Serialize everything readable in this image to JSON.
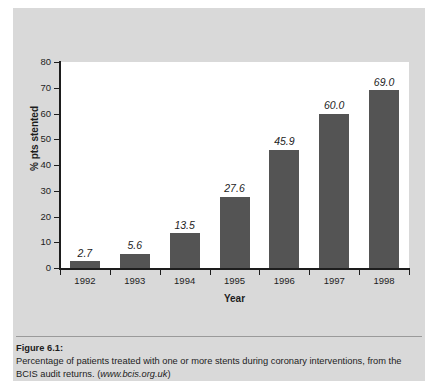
{
  "figure": {
    "caption_title": "Figure 6.1:",
    "caption_body_before": "Percentage of patients treated with one or more stents during coronary interventions, from the BCIS audit returns. (",
    "caption_url": "www.bcis.org.uk",
    "caption_body_after": ")"
  },
  "colors": {
    "panel_background": "#d9d9d9",
    "plot_background": "#ffffff",
    "bar_fill": "#545454",
    "axis": "#1d1d1d",
    "page_background": "#ffffff"
  },
  "chart_data": {
    "type": "bar",
    "title": "",
    "xlabel": "Year",
    "ylabel": "% pts stented",
    "categories": [
      "1992",
      "1993",
      "1994",
      "1995",
      "1996",
      "1997",
      "1998"
    ],
    "values": [
      2.7,
      5.6,
      13.5,
      27.6,
      45.9,
      60.0,
      69.0
    ],
    "data_labels": [
      "2.7",
      "5.6",
      "13.5",
      "27.6",
      "45.9",
      "60.0",
      "69.0"
    ],
    "ylim": [
      0,
      80
    ],
    "ytick_values": [
      0,
      10,
      20,
      30,
      40,
      50,
      60,
      70,
      80
    ],
    "ytick_labels": [
      "0",
      "10",
      "20",
      "30",
      "40",
      "50",
      "60",
      "70",
      "80"
    ],
    "grid": false,
    "legend": false,
    "legend_position": "none",
    "series": [
      {
        "name": "% pts stented",
        "values": [
          2.7,
          5.6,
          13.5,
          27.6,
          45.9,
          60.0,
          69.0
        ]
      }
    ]
  }
}
